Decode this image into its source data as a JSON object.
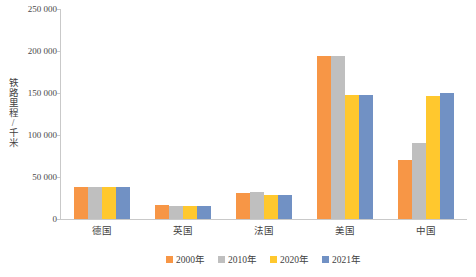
{
  "chart_data": {
    "type": "bar",
    "title": "",
    "xlabel": "",
    "ylabel": "铁路里程/千米",
    "ylim": [
      0,
      250000
    ],
    "ytick_values": [
      250000,
      200000,
      150000,
      100000,
      50000,
      0
    ],
    "ytick_labels": [
      "250 000",
      "200 000",
      "150 000",
      "100 000",
      "50 000",
      "0"
    ],
    "grid": false,
    "legend_position": "bottom",
    "categories": [
      "德国",
      "英国",
      "法国",
      "美国",
      "中国"
    ],
    "series": [
      {
        "name": "2000年",
        "color": "#F79646",
        "values": [
          38000,
          17000,
          31000,
          194000,
          70000
        ]
      },
      {
        "name": "2010年",
        "color": "#BFBFBF",
        "values": [
          38000,
          16000,
          32000,
          194000,
          91000
        ]
      },
      {
        "name": "2020年",
        "color": "#FFC82E",
        "values": [
          38000,
          16000,
          29000,
          148000,
          146000
        ]
      },
      {
        "name": "2021年",
        "color": "#7191C4",
        "values": [
          38000,
          16000,
          28000,
          148000,
          150000
        ]
      }
    ]
  },
  "legend": {
    "items": [
      {
        "label": "2000年"
      },
      {
        "label": "2010年"
      },
      {
        "label": "2020年"
      },
      {
        "label": "2021年"
      }
    ]
  }
}
